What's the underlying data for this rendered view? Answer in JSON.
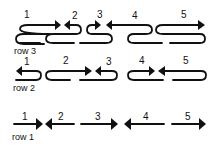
{
  "diagram": {
    "rows": [
      {
        "label": "row 3",
        "segments": [
          {
            "num": "1",
            "direction": "right"
          },
          {
            "num": "2",
            "direction": "left"
          },
          {
            "num": "3",
            "direction": "right"
          },
          {
            "num": "4",
            "direction": "left"
          },
          {
            "num": "5",
            "direction": "right"
          }
        ]
      },
      {
        "label": "row 2",
        "segments": [
          {
            "num": "1",
            "direction": "left"
          },
          {
            "num": "2",
            "direction": "right"
          },
          {
            "num": "3",
            "direction": "left"
          },
          {
            "num": "4",
            "direction": "right"
          },
          {
            "num": "5",
            "direction": "left"
          }
        ]
      },
      {
        "label": "row 1",
        "segments": [
          {
            "num": "1",
            "direction": "right"
          },
          {
            "num": "2",
            "direction": "left"
          },
          {
            "num": "3",
            "direction": "right"
          },
          {
            "num": "4",
            "direction": "left"
          },
          {
            "num": "5",
            "direction": "right"
          }
        ]
      }
    ],
    "colors": {
      "ink": "#111111",
      "background": "#ffffff"
    }
  }
}
